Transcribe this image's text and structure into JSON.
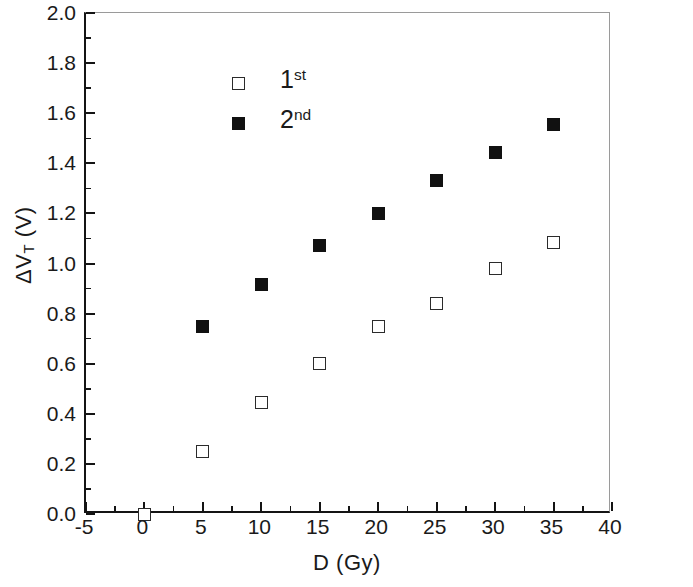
{
  "chart_data": {
    "type": "scatter",
    "title": "",
    "xlabel": "D (Gy)",
    "ylabel": "ΔV_T (V)",
    "ylabel_parts": {
      "prefix": "ΔV",
      "subscript": "T",
      "suffix": " (V)"
    },
    "xlim": [
      -5,
      40
    ],
    "ylim": [
      0.0,
      2.0
    ],
    "x_major_ticks": [
      -5,
      0,
      5,
      10,
      15,
      20,
      25,
      30,
      35,
      40
    ],
    "x_tick_labels": [
      "-5",
      "0",
      "5",
      "10",
      "15",
      "20",
      "25",
      "30",
      "35",
      "40"
    ],
    "x_minor_ticks": [
      -2.5,
      2.5,
      7.5,
      12.5,
      17.5,
      22.5,
      27.5,
      32.5,
      37.5
    ],
    "y_major_ticks": [
      0.0,
      0.2,
      0.4,
      0.6,
      0.8,
      1.0,
      1.2,
      1.4,
      1.6,
      1.8,
      2.0
    ],
    "y_tick_labels": [
      "0.0",
      "0.2",
      "0.4",
      "0.6",
      "0.8",
      "1.0",
      "1.2",
      "1.4",
      "1.6",
      "1.8",
      "2.0"
    ],
    "y_minor_ticks": [
      0.1,
      0.3,
      0.5,
      0.7,
      0.9,
      1.1,
      1.3,
      1.5,
      1.7,
      1.9
    ],
    "grid": false,
    "legend_position": "upper-left-inside",
    "marker_color": "#111111",
    "axis_color": "#141414",
    "frame_color": "#9a9a9a",
    "series": [
      {
        "name": "1st",
        "name_base": "1",
        "name_sup": "st",
        "marker": "open-square",
        "x": [
          0,
          5,
          10,
          15,
          20,
          25,
          30,
          35
        ],
        "values": [
          0.0,
          0.25,
          0.445,
          0.6,
          0.75,
          0.84,
          0.98,
          1.085
        ]
      },
      {
        "name": "2nd",
        "name_base": "2",
        "name_sup": "nd",
        "marker": "filled-square",
        "x": [
          5,
          10,
          15,
          20,
          25,
          30,
          35
        ],
        "values": [
          0.75,
          0.915,
          1.07,
          1.2,
          1.33,
          1.445,
          1.555
        ]
      }
    ]
  }
}
